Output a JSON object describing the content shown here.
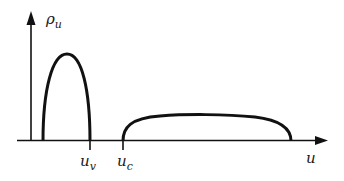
{
  "diagram": {
    "y_axis_label": {
      "main": "ρ",
      "sub": "u"
    },
    "x_axis_label": "u",
    "markers": [
      {
        "main": "u",
        "sub": "v"
      },
      {
        "main": "u",
        "sub": "c"
      }
    ],
    "curves": [
      {
        "name": "narrow-lobe",
        "x_start": 43,
        "x_end": 90,
        "peak_y": 54
      },
      {
        "name": "wide-lobe",
        "x_start": 123,
        "x_end": 291,
        "peak_y": 115
      }
    ],
    "colors": {
      "stroke": "#111111",
      "background": "#ffffff"
    }
  }
}
